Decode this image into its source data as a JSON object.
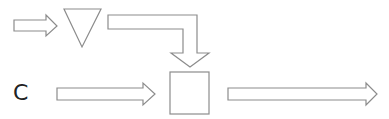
{
  "diagram": {
    "stroke_color": "#8c8c8c",
    "fill_color": "#ffffff",
    "labels": {
      "input_c": "C"
    },
    "nodes": [
      {
        "id": "triangle",
        "shape": "inverted-triangle"
      },
      {
        "id": "square",
        "shape": "square"
      }
    ],
    "edges": [
      {
        "id": "arrow-into-triangle",
        "from": "input",
        "to": "triangle",
        "shape": "block-arrow-right"
      },
      {
        "id": "elbow-arrow",
        "from": "triangle",
        "to": "square",
        "shape": "elbow-block-arrow-down"
      },
      {
        "id": "arrow-c-to-square",
        "from": "C",
        "to": "square",
        "shape": "block-arrow-right"
      },
      {
        "id": "output-arrow",
        "from": "square",
        "to": "output",
        "shape": "block-arrow-right"
      }
    ]
  }
}
